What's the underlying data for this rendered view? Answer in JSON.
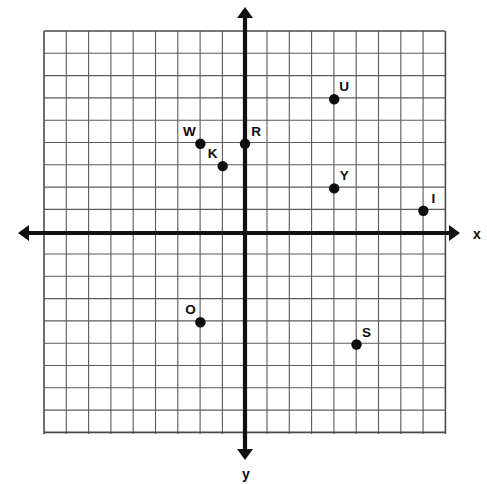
{
  "chart_data": {
    "type": "scatter",
    "title": "",
    "xlabel": "x",
    "ylabel": "y",
    "grid": true,
    "legend": "none",
    "xlim": [
      -9,
      9
    ],
    "ylim": [
      -9,
      9
    ],
    "grid_step": 1,
    "grid_cols": 18,
    "grid_rows": 18,
    "tick_labels_shown": false,
    "points": [
      {
        "label": "W",
        "x": -2,
        "y": 4,
        "label_dx": -11,
        "label_dy": -8
      },
      {
        "label": "K",
        "x": -1,
        "y": 3,
        "label_dx": -10,
        "label_dy": -8
      },
      {
        "label": "R",
        "x": 0,
        "y": 4,
        "label_dx": 11,
        "label_dy": -8
      },
      {
        "label": "U",
        "x": 4,
        "y": 6,
        "label_dx": 10,
        "label_dy": -8
      },
      {
        "label": "Y",
        "x": 4,
        "y": 2,
        "label_dx": 10,
        "label_dy": -8
      },
      {
        "label": "I",
        "x": 8,
        "y": 1,
        "label_dx": 10,
        "label_dy": -8
      },
      {
        "label": "O",
        "x": -2,
        "y": -4,
        "label_dx": -10,
        "label_dy": -8
      },
      {
        "label": "S",
        "x": 5,
        "y": -5,
        "label_dx": 10,
        "label_dy": -8
      }
    ]
  },
  "geometry": {
    "origin_x": 245,
    "origin_y": 233,
    "cell": 22.3,
    "grid_left": 44,
    "grid_top": 31,
    "grid_right": 445,
    "grid_bottom": 434,
    "x_axis_left_end": 18,
    "x_axis_right_end": 460,
    "y_axis_top_end": 7,
    "y_axis_bottom_end": 460
  },
  "axes": {
    "x_label": "x",
    "y_label": "y",
    "x_label_pos": {
      "x": 477,
      "y": 239
    },
    "y_label_pos": {
      "x": 246,
      "y": 479
    }
  },
  "colors": {
    "background": "#ffffff",
    "grid": "#5a5a5a",
    "grid_border": "#4a4a4a",
    "axis": "#111111",
    "point": "#0d0d0d",
    "label": "#0d0d0d"
  },
  "point_radius": 5.2
}
